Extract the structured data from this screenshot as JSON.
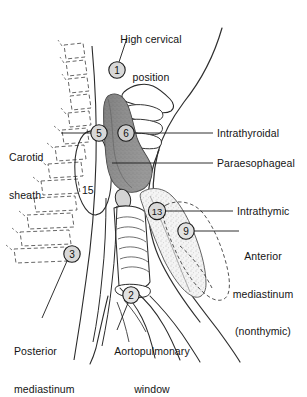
{
  "figure": {
    "title": "High cervical position",
    "background_color": "#ffffff",
    "ink_color": "#1a1a1a",
    "thyroid_fill": "#8d8d8d",
    "thymus_fill": "#efefef"
  },
  "labels": {
    "high_cervical": {
      "line1": "High cervical",
      "line2": "position"
    },
    "carotid_sheath": {
      "line1": "Carotid",
      "line2": "sheath"
    },
    "intrathyroidal": "Intrathyroidal",
    "paraesophageal": "Paraesophageal",
    "intrathymic": "Intrathymic",
    "anterior_mediastinum": {
      "line1": "Anterior",
      "line2": "mediastinum",
      "line3": "(nonthymic)"
    },
    "posterior_mediastinum": {
      "line1": "Posterior",
      "line2": "mediastinum"
    },
    "aortopulmonary_window": {
      "line1": "Aortopulmonary",
      "line2": "window"
    }
  },
  "markers": [
    {
      "id": "marker-1",
      "number": "1",
      "x": 117,
      "y": 70,
      "label": "high_cervical"
    },
    {
      "id": "marker-5",
      "number": "5",
      "x": 99,
      "y": 133,
      "label": "carotid_sheath"
    },
    {
      "id": "marker-6",
      "number": "6",
      "x": 126,
      "y": 133,
      "label": "intrathyroidal"
    },
    {
      "id": "marker-3",
      "number": "3",
      "x": 72,
      "y": 254,
      "label": "posterior_mediastinum"
    },
    {
      "id": "marker-13",
      "number": "13",
      "x": 157,
      "y": 211,
      "label": "intrathymic"
    },
    {
      "id": "marker-9",
      "number": "9",
      "x": 186,
      "y": 231,
      "label": "anterior_mediastinum"
    },
    {
      "id": "marker-2",
      "number": "2",
      "x": 131,
      "y": 295,
      "label": "aortopulmonary_window"
    }
  ],
  "plain_numbers": [
    {
      "id": "number-15",
      "number": "15",
      "x": 88,
      "y": 190
    }
  ]
}
